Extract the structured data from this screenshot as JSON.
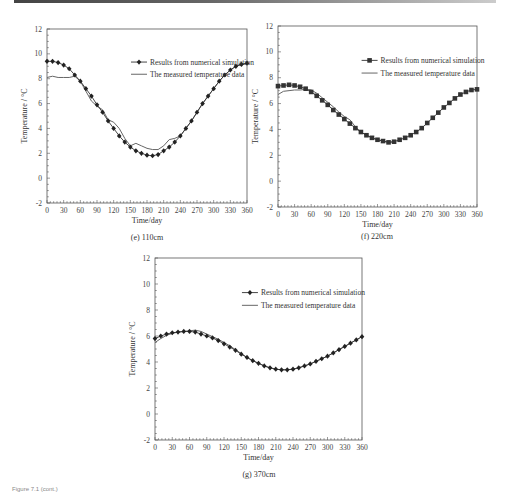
{
  "footer": {
    "text": "Figure 7.1 (cont.)"
  },
  "chart_data": [
    {
      "id": "e",
      "type": "line",
      "caption": "(e) 110cm",
      "xlabel": "Time/day",
      "ylabel": "Temperature / °C",
      "xlim": [
        0,
        360
      ],
      "ylim": [
        -2,
        12
      ],
      "xticks": [
        0,
        30,
        60,
        90,
        120,
        150,
        180,
        210,
        240,
        270,
        300,
        330,
        360
      ],
      "yticks": [
        -2,
        0,
        2,
        4,
        6,
        8,
        10,
        12
      ],
      "legend": [
        "Results from numerical simulation",
        "The measured temperature data"
      ],
      "legend_position": "upper right",
      "marker": "diamond",
      "series": [
        {
          "name": "Results from numerical simulation",
          "x": [
            0,
            10,
            20,
            30,
            40,
            50,
            60,
            70,
            80,
            90,
            100,
            110,
            120,
            130,
            140,
            150,
            160,
            170,
            180,
            190,
            200,
            210,
            220,
            230,
            240,
            250,
            260,
            270,
            280,
            290,
            300,
            310,
            320,
            330,
            340,
            350,
            360
          ],
          "values": [
            9.4,
            9.4,
            9.3,
            9.1,
            8.8,
            8.3,
            7.8,
            7.2,
            6.6,
            5.9,
            5.3,
            4.6,
            4.0,
            3.4,
            2.9,
            2.5,
            2.2,
            2.0,
            1.85,
            1.8,
            1.9,
            2.2,
            2.5,
            2.9,
            3.4,
            4.0,
            4.6,
            5.3,
            6.0,
            6.6,
            7.2,
            7.8,
            8.3,
            8.7,
            9.0,
            9.15,
            9.25
          ]
        },
        {
          "name": "The measured temperature data",
          "x": [
            0,
            10,
            20,
            30,
            40,
            50,
            60,
            70,
            80,
            90,
            100,
            110,
            120,
            130,
            140,
            150,
            160,
            170,
            180,
            190,
            200,
            210,
            220,
            230,
            240,
            250,
            260,
            270,
            280,
            290,
            300,
            310,
            320,
            330,
            340,
            350,
            360
          ],
          "values": [
            8.1,
            8.2,
            8.1,
            8.1,
            8.1,
            8.2,
            7.8,
            7.0,
            6.2,
            5.8,
            5.5,
            4.7,
            4.5,
            4.0,
            3.2,
            2.6,
            2.8,
            2.6,
            2.4,
            2.3,
            2.3,
            2.6,
            3.1,
            3.2,
            3.4,
            4.0,
            4.6,
            5.3,
            6.0,
            6.6,
            7.2,
            7.8,
            8.3,
            8.7,
            9.0,
            9.15,
            9.25
          ]
        }
      ]
    },
    {
      "id": "f",
      "type": "line",
      "caption": "(f) 220cm",
      "xlabel": "Time/day",
      "ylabel": "Temperature / °C",
      "xlim": [
        0,
        360
      ],
      "ylim": [
        -2,
        12
      ],
      "xticks": [
        0,
        30,
        60,
        90,
        120,
        150,
        180,
        210,
        240,
        270,
        300,
        330,
        360
      ],
      "yticks": [
        -2,
        0,
        2,
        4,
        6,
        8,
        10,
        12
      ],
      "legend": [
        "Results from numerical simulation",
        "The measured temperature data"
      ],
      "legend_position": "upper right",
      "marker": "square",
      "series": [
        {
          "name": "Results from numerical simulation",
          "x": [
            0,
            10,
            20,
            30,
            40,
            50,
            60,
            70,
            80,
            90,
            100,
            110,
            120,
            130,
            140,
            150,
            160,
            170,
            180,
            190,
            200,
            210,
            220,
            230,
            240,
            250,
            260,
            270,
            280,
            290,
            300,
            310,
            320,
            330,
            340,
            350,
            360
          ],
          "values": [
            7.35,
            7.4,
            7.45,
            7.4,
            7.3,
            7.15,
            6.9,
            6.6,
            6.25,
            5.9,
            5.5,
            5.15,
            4.8,
            4.45,
            4.1,
            3.8,
            3.55,
            3.35,
            3.2,
            3.1,
            3.0,
            3.05,
            3.2,
            3.35,
            3.55,
            3.8,
            4.1,
            4.5,
            4.9,
            5.3,
            5.7,
            6.05,
            6.4,
            6.7,
            6.9,
            7.05,
            7.1
          ]
        },
        {
          "name": "The measured temperature data",
          "x": [
            0,
            10,
            20,
            30,
            40,
            50,
            60,
            70,
            80,
            90,
            100,
            110,
            120,
            130,
            140,
            150,
            160,
            170,
            180,
            190,
            200,
            210
          ],
          "values": [
            6.7,
            6.95,
            7.0,
            7.05,
            7.05,
            7.1,
            7.05,
            6.8,
            6.45,
            6.1,
            5.75,
            5.35,
            5.0,
            4.75,
            4.2,
            3.8,
            3.55,
            3.35,
            3.2,
            3.1,
            3.0,
            3.05
          ]
        }
      ]
    },
    {
      "id": "g",
      "type": "line",
      "caption": "(g) 370cm",
      "xlabel": "Time/day",
      "ylabel": "Temperature / °C",
      "xlim": [
        0,
        360
      ],
      "ylim": [
        -2,
        12
      ],
      "xticks": [
        0,
        30,
        60,
        90,
        120,
        150,
        180,
        210,
        240,
        270,
        300,
        330,
        360
      ],
      "yticks": [
        -2,
        0,
        2,
        4,
        6,
        8,
        10,
        12
      ],
      "legend": [
        "Results from numerical simulation",
        "The measured temperature data"
      ],
      "legend_position": "upper right",
      "marker": "diamond",
      "series": [
        {
          "name": "Results from numerical simulation",
          "x": [
            0,
            10,
            20,
            30,
            40,
            50,
            60,
            70,
            80,
            90,
            100,
            110,
            120,
            130,
            140,
            150,
            160,
            170,
            180,
            190,
            200,
            210,
            220,
            230,
            240,
            250,
            260,
            270,
            280,
            290,
            300,
            310,
            320,
            330,
            340,
            350,
            360
          ],
          "values": [
            5.8,
            6.0,
            6.15,
            6.25,
            6.3,
            6.35,
            6.35,
            6.3,
            6.15,
            6.0,
            5.85,
            5.65,
            5.4,
            5.15,
            4.9,
            4.6,
            4.35,
            4.1,
            3.9,
            3.7,
            3.55,
            3.45,
            3.4,
            3.4,
            3.45,
            3.55,
            3.7,
            3.85,
            4.05,
            4.25,
            4.45,
            4.7,
            4.95,
            5.2,
            5.45,
            5.7,
            5.95
          ]
        },
        {
          "name": "The measured temperature data",
          "x": [
            0,
            10,
            20,
            30,
            40,
            50,
            60,
            70,
            80,
            90,
            100,
            110,
            120,
            130,
            140,
            150,
            160,
            170,
            180,
            190,
            200,
            210,
            220,
            230,
            240,
            250,
            260,
            270,
            280,
            290,
            300,
            310,
            320,
            330,
            340,
            350,
            360
          ],
          "values": [
            5.5,
            5.8,
            6.05,
            6.2,
            6.3,
            6.35,
            6.4,
            6.45,
            6.35,
            6.15,
            5.95,
            5.75,
            5.5,
            5.25,
            4.95,
            4.65,
            4.35,
            4.1,
            3.9,
            3.7,
            3.55,
            3.45,
            3.4,
            3.4,
            3.45,
            3.55,
            3.7,
            3.85,
            4.05,
            4.25,
            4.45,
            4.7,
            4.95,
            5.2,
            5.45,
            5.7,
            5.95
          ]
        }
      ]
    }
  ]
}
